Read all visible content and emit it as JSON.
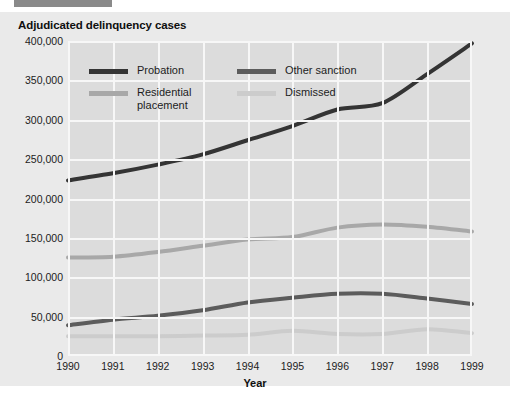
{
  "header": {
    "bar_color": "#8a8a8a"
  },
  "figure": {
    "title": "Adjudicated delinquency cases",
    "background": "#eaeaea",
    "plot_background": "#dcdcdc",
    "gridline_color": "#f7f7f7"
  },
  "chart_data": {
    "type": "line",
    "title": "Adjudicated delinquency cases",
    "xlabel": "Year",
    "ylabel": "",
    "x": [
      1990,
      1991,
      1992,
      1993,
      1994,
      1995,
      1996,
      1997,
      1998,
      1999
    ],
    "categories": [
      "1990",
      "1991",
      "1992",
      "1993",
      "1994",
      "1995",
      "1996",
      "1997",
      "1998",
      "1999"
    ],
    "xlim": [
      1990,
      1999
    ],
    "ylim": [
      0,
      400000
    ],
    "ytick_labels": [
      "0",
      "50,000",
      "100,000",
      "150,000",
      "200,000",
      "250,000",
      "300,000",
      "350,000",
      "400,000"
    ],
    "ytick_values": [
      0,
      50000,
      100000,
      150000,
      200000,
      250000,
      300000,
      350000,
      400000
    ],
    "grid": true,
    "legend_position": "upper-left-inside",
    "series": [
      {
        "name": "Probation",
        "color": "#343434",
        "values": [
          223000,
          232000,
          243000,
          256000,
          274000,
          292000,
          313000,
          321000,
          358000,
          397000
        ]
      },
      {
        "name": "Other sanction",
        "color": "#5c5c5c",
        "values": [
          39000,
          46000,
          51000,
          58000,
          68000,
          74000,
          79000,
          79000,
          73000,
          66000
        ]
      },
      {
        "name": "Residential placement",
        "color": "#a8a8a8",
        "values": [
          125000,
          126000,
          132000,
          140000,
          148000,
          151000,
          163000,
          167000,
          164000,
          158000
        ]
      },
      {
        "name": "Dismissed",
        "color": "#cccccc",
        "values": [
          25000,
          25000,
          25000,
          26000,
          27000,
          32000,
          28000,
          28000,
          34000,
          29000
        ]
      }
    ]
  }
}
